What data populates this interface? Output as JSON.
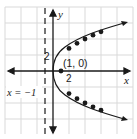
{
  "diagram": {
    "equation_implied": "y^2 = 4x",
    "axes": {
      "x_label": "x",
      "y_label": "y",
      "x_tick_label": "2",
      "y_tick_label": "2",
      "units_per_grid": 2
    },
    "focus": {
      "label": "(1, 0)",
      "x": 1,
      "y": 0
    },
    "directrix": {
      "label": "x = −1",
      "x": -1
    },
    "plotted_points": [
      {
        "x": 2,
        "y": 2.83
      },
      {
        "x": 3,
        "y": 3.46
      },
      {
        "x": 4,
        "y": 4
      },
      {
        "x": 5,
        "y": 4.47
      },
      {
        "x": 6,
        "y": 4.9
      },
      {
        "x": 2,
        "y": -2.83
      },
      {
        "x": 3,
        "y": -3.46
      },
      {
        "x": 4,
        "y": -4
      },
      {
        "x": 5,
        "y": -4.47
      },
      {
        "x": 6,
        "y": -4.9
      }
    ],
    "colors": {
      "grid": "#d9d9d9",
      "axis": "#1a1a1a",
      "curve": "#1a1a1a",
      "points": "#1a1a1a"
    }
  }
}
